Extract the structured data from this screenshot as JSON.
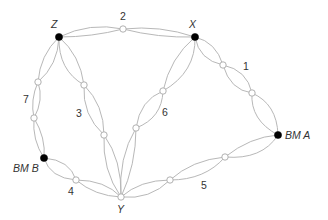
{
  "diagram": {
    "type": "levelling network",
    "stations": {
      "Z": {
        "label": "Z",
        "kind": "fixed"
      },
      "X": {
        "label": "X",
        "kind": "fixed"
      },
      "Y": {
        "label": "Y",
        "kind": "junction"
      },
      "BMA": {
        "label": "BM A",
        "kind": "benchmark"
      },
      "BMB": {
        "label": "BM B",
        "kind": "benchmark"
      }
    },
    "lines": [
      {
        "id": "1",
        "label": "1",
        "from": "X",
        "to": "BM A"
      },
      {
        "id": "2",
        "label": "2",
        "from": "Z",
        "to": "X"
      },
      {
        "id": "3",
        "label": "3",
        "from": "Z",
        "to": "Y"
      },
      {
        "id": "4",
        "label": "4",
        "from": "BM B",
        "to": "Y"
      },
      {
        "id": "5",
        "label": "5",
        "from": "Y",
        "to": "BM A"
      },
      {
        "id": "6",
        "label": "6",
        "from": "X",
        "to": "Y"
      },
      {
        "id": "7",
        "label": "7",
        "from": "Z",
        "to": "BM B"
      }
    ],
    "colors": {
      "line": "#b8b8b8",
      "fixed_point": "#000000",
      "turning_point": "#ffffff",
      "label": "#333333"
    }
  }
}
